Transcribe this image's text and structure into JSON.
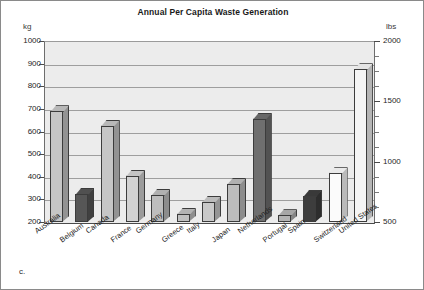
{
  "figure": {
    "panel_letter": "c.",
    "background": "#ffffff",
    "plot_background": "#ececec",
    "frame_color": "#8a8a8a"
  },
  "chart_data": {
    "type": "bar",
    "title": "Annual Per Capita Waste Generation",
    "xlabel": "",
    "ylabel": "kg",
    "ylabel_right": "lbs",
    "ylim": [
      200,
      1000
    ],
    "ylim_right": [
      500,
      2000
    ],
    "yticks": [
      1000,
      900,
      800,
      700,
      600,
      500,
      400,
      300,
      200
    ],
    "yticks_right": [
      2000,
      1500,
      1000,
      500
    ],
    "yticks_right_minor": [
      1875,
      1750,
      1625,
      1375,
      1250,
      1125,
      875,
      750,
      625
    ],
    "grid": true,
    "legend": "none",
    "categories": [
      "Australia",
      "Belgium",
      "Canada",
      "France",
      "Germany",
      "Greece",
      "Italy",
      "Japan",
      "Netherlands",
      "Portugal",
      "Spain",
      "Switzerland",
      "United States"
    ],
    "values": [
      690,
      325,
      625,
      405,
      320,
      235,
      290,
      370,
      655,
      230,
      315,
      415,
      875
    ],
    "bar_fills": [
      "#c6c6c6",
      "#565656",
      "#c6c6c6",
      "#d2d2d2",
      "#bdbdbd",
      "#c0c0c0",
      "#c9c9c9",
      "#bdbdbd",
      "#6f6f6f",
      "#b4b4b4",
      "#3d3d3d",
      "#fbfbfb",
      "#f5f5f5"
    ]
  }
}
